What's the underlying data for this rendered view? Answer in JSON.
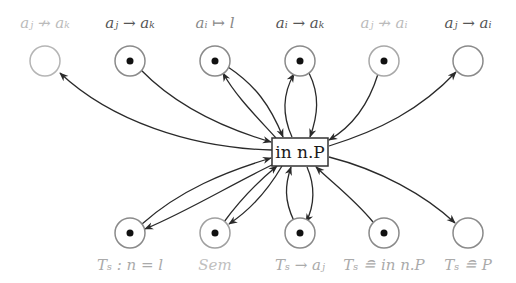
{
  "diagram": {
    "center_node": {
      "label": "in n.P",
      "x": 300,
      "y": 152,
      "w": 56,
      "h": 28
    },
    "top_nodes": [
      {
        "label": "a_j ↛ a_k",
        "display": "aⱼ ↛ aₖ",
        "x": 45,
        "y": 61,
        "token": false,
        "faded": true
      },
      {
        "label": "a_j → a_k",
        "display": "aⱼ → aₖ",
        "x": 130,
        "y": 61,
        "token": true,
        "faded": false
      },
      {
        "label": "a_i ↦ l",
        "display": "aᵢ ↦ l",
        "x": 215,
        "y": 61,
        "token": true,
        "faded": false
      },
      {
        "label": "a_i → a_k",
        "display": "aᵢ → aₖ",
        "x": 300,
        "y": 61,
        "token": true,
        "faded": false
      },
      {
        "label": "a_j ↛ a_i",
        "display": "aⱼ ↛ aᵢ",
        "x": 384,
        "y": 61,
        "token": true,
        "faded": true
      },
      {
        "label": "a_j → a_i",
        "display": "aⱼ → aᵢ",
        "x": 468,
        "y": 61,
        "token": false,
        "faded": false
      }
    ],
    "bottom_nodes": [
      {
        "label": "T_s : n = l",
        "display": "Tₛ : n = l",
        "x": 130,
        "y": 233,
        "token": true
      },
      {
        "label": "Sem",
        "display": "Sem",
        "x": 215,
        "y": 233,
        "token": true
      },
      {
        "label": "T_s → a_j",
        "display": "Tₛ → aⱼ",
        "x": 300,
        "y": 233,
        "token": true
      },
      {
        "label": "T_s ≘ in n.P",
        "display": "Tₛ ≘ in n.P",
        "x": 384,
        "y": 233,
        "token": true
      },
      {
        "label": "T_s ≘ P",
        "display": "Tₛ ≘ P",
        "x": 468,
        "y": 233,
        "token": false
      }
    ],
    "edges": [
      {
        "from": "center",
        "to": "top0",
        "direction": "out"
      },
      {
        "from": "top1",
        "to": "center",
        "direction": "in"
      },
      {
        "from": "top2",
        "to": "center",
        "direction": "in"
      },
      {
        "from": "center",
        "to": "top2",
        "direction": "out"
      },
      {
        "from": "top3",
        "to": "center",
        "direction": "in"
      },
      {
        "from": "center",
        "to": "top3",
        "direction": "out"
      },
      {
        "from": "top4",
        "to": "center",
        "direction": "in"
      },
      {
        "from": "center",
        "to": "top5",
        "direction": "out"
      },
      {
        "from": "bottom0",
        "to": "center",
        "direction": "in"
      },
      {
        "from": "center",
        "to": "bottom0",
        "direction": "out"
      },
      {
        "from": "bottom1",
        "to": "center",
        "direction": "in"
      },
      {
        "from": "center",
        "to": "bottom1",
        "direction": "out"
      },
      {
        "from": "bottom2",
        "to": "center",
        "direction": "in"
      },
      {
        "from": "center",
        "to": "bottom2",
        "direction": "out"
      },
      {
        "from": "bottom3",
        "to": "center",
        "direction": "in"
      },
      {
        "from": "center",
        "to": "bottom4",
        "direction": "out"
      }
    ],
    "colors": {
      "edge": "#2a2a2a",
      "place_stroke": "#8a8a8a",
      "token": "#111111",
      "box_stroke": "#333333"
    }
  }
}
